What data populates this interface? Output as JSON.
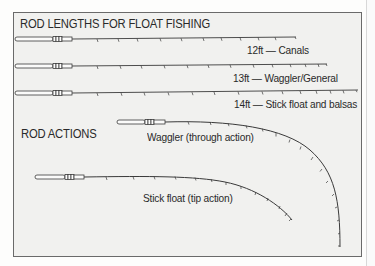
{
  "title": "ROD LENGTHS FOR FLOAT FISHING",
  "rod_lengths": [
    {
      "label": "12ft — Canals"
    },
    {
      "label": "13ft — Waggler/General"
    },
    {
      "label": "14ft — Stick float and balsas"
    }
  ],
  "actions_heading": "ROD ACTIONS",
  "rod_actions": [
    {
      "label": "Waggler (through action)"
    },
    {
      "label": "Stick float (tip action)"
    }
  ],
  "colors": {
    "frame_border": "#6a6a6a",
    "background": "#f1f1ef",
    "line": "#3a3a3a",
    "text": "#2a2a2a"
  }
}
